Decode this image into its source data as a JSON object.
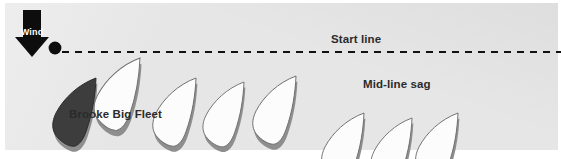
{
  "diagram": {
    "background_color": "#e2e2e2",
    "frame_color": "#ffffff"
  },
  "wind": {
    "label": "Wind",
    "direction": "down",
    "arrow_color": "#0d0d0d",
    "label_color": "#ffffff"
  },
  "start_line": {
    "label": "Start line",
    "style": "dashed",
    "color": "#111111",
    "y": 52
  },
  "pin_buoy": {
    "name": "pin-end-buoy",
    "color": "#0d0d0d",
    "x": 55,
    "y": 48,
    "radius": 6
  },
  "annotations": {
    "mid_line_sag": "Mid-line sag",
    "highlighted_boat": "Brooke Big Fleet"
  },
  "boats": [
    {
      "id": "brooke-big-fleet",
      "fill": "#3d3d3d",
      "highlighted": true,
      "x": 96,
      "y": 78,
      "rot": 38,
      "scale": 1.0
    },
    {
      "id": "boat-1",
      "fill": "#fcfcfc",
      "highlighted": false,
      "x": 140,
      "y": 58,
      "rot": 38,
      "scale": 1.06
    },
    {
      "id": "boat-2",
      "fill": "#fcfcfc",
      "highlighted": false,
      "x": 196,
      "y": 78,
      "rot": 38,
      "scale": 1.0
    },
    {
      "id": "boat-3",
      "fill": "#fcfcfc",
      "highlighted": false,
      "x": 244,
      "y": 82,
      "rot": 38,
      "scale": 0.95
    },
    {
      "id": "boat-4",
      "fill": "#fcfcfc",
      "highlighted": false,
      "x": 296,
      "y": 76,
      "rot": 38,
      "scale": 1.0
    },
    {
      "id": "boat-5",
      "fill": "#fcfcfc",
      "highlighted": false,
      "x": 364,
      "y": 113,
      "rot": 38,
      "scale": 0.98
    },
    {
      "id": "boat-6",
      "fill": "#fcfcfc",
      "highlighted": false,
      "x": 412,
      "y": 118,
      "rot": 38,
      "scale": 0.95
    },
    {
      "id": "boat-7",
      "fill": "#fcfcfc",
      "highlighted": false,
      "x": 458,
      "y": 113,
      "rot": 38,
      "scale": 0.98
    }
  ],
  "colors": {
    "hull_white": "#fcfcfc",
    "hull_dark": "#3d3d3d",
    "hull_shadow": "#8e8e8e",
    "hull_outline": "#6e6e6e",
    "text": "#2b2b2b",
    "line": "#111111"
  }
}
